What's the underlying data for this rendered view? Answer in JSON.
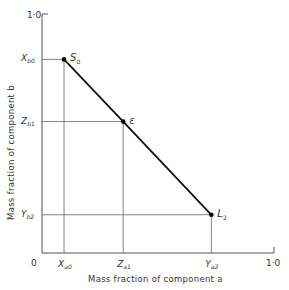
{
  "chart_data": {
    "type": "line",
    "title": "",
    "xlabel": "Mass fraction of component a",
    "ylabel": "Mass fraction of component b",
    "xlim": [
      0,
      1.0
    ],
    "ylim": [
      0,
      1.0
    ],
    "grid": false,
    "origin_label": "0",
    "x_max_label": "1·0",
    "y_max_label": "1·0",
    "points": [
      {
        "name": "S0",
        "label_main": "S",
        "label_sub": "0",
        "x": 0.095,
        "y": 0.81
      },
      {
        "name": "epsilon",
        "label_main": "ε",
        "label_sub": "",
        "x": 0.35,
        "y": 0.55
      },
      {
        "name": "L2",
        "label_main": "L",
        "label_sub": "2",
        "x": 0.73,
        "y": 0.16
      }
    ],
    "series": [
      {
        "name": "tie-line S0-ε-L2",
        "x": [
          0.095,
          0.35,
          0.73
        ],
        "y": [
          0.81,
          0.55,
          0.16
        ]
      }
    ],
    "x_ticks": [
      {
        "main": "X",
        "sub": "a0",
        "value": 0.095
      },
      {
        "main": "Z",
        "sub": "a1",
        "value": 0.35
      },
      {
        "main": "Y",
        "sub": "a2",
        "value": 0.73
      }
    ],
    "y_ticks": [
      {
        "main": "X",
        "sub": "b0",
        "value": 0.81
      },
      {
        "main": "Z",
        "sub": "b1",
        "value": 0.55
      },
      {
        "main": "Y",
        "sub": "b2",
        "value": 0.16
      }
    ]
  },
  "colors": {
    "axis": "#555555",
    "guide": "#666666",
    "line": "#111111",
    "text": "#333333"
  }
}
